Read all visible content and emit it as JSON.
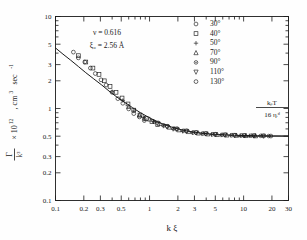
{
  "figure": {
    "background": "#fefefe",
    "ink": "#1a1a1a"
  },
  "annotations": {
    "nu": "ν = 0.616",
    "xi0": "ξ₀ = 2.56 Å",
    "asymptote_numerator": "kᵦT",
    "asymptote_denominator": "16 ηᵢᵈ"
  },
  "axes": {
    "xlabel": "k ξ",
    "ylabel": "Γ/k³ × 10¹² , cm³ sec⁻¹",
    "ylabel_parts": {
      "gamma": "Γ",
      "k3": "k³",
      "rest": "× 10",
      "exp": "12",
      "units": ", cm",
      "units_exp": "3",
      "units_tail": " sec",
      "units_tail_exp": "-1"
    },
    "xscale": "log",
    "yscale": "log",
    "xlim": [
      0.1,
      30
    ],
    "ylim": [
      0.1,
      10
    ],
    "xticks": [
      0.1,
      0.2,
      0.3,
      0.5,
      1,
      2,
      3,
      5,
      10,
      20,
      30
    ],
    "xticklabels": [
      "0.1",
      "0.2",
      "0.3",
      "0.5",
      "1",
      "2",
      "3",
      "5",
      "10",
      "20",
      "30"
    ],
    "yticks": [
      0.1,
      0.2,
      0.3,
      0.5,
      1,
      2,
      3,
      5,
      10
    ],
    "yticklabels": [
      "0.1",
      "0.2",
      "0.3",
      "0.5",
      "1",
      "2",
      "3",
      "5",
      "10"
    ],
    "grid": false,
    "ticks_direction": "in"
  },
  "legend": {
    "position": "top-right-inside",
    "entries": [
      {
        "label": "30°",
        "marker": "circle"
      },
      {
        "label": "40°",
        "marker": "square"
      },
      {
        "label": "50°",
        "marker": "plus"
      },
      {
        "label": "70°",
        "marker": "triangle-up"
      },
      {
        "label": "90°",
        "marker": "asterisk"
      },
      {
        "label": "110°",
        "marker": "triangle-down"
      },
      {
        "label": "130°",
        "marker": "hexagon"
      }
    ]
  },
  "chart_data": {
    "type": "scatter",
    "title": "",
    "xlabel": "k ξ",
    "ylabel": "Γ/k³ × 10¹² , cm³ sec⁻¹",
    "xscale": "log",
    "yscale": "log",
    "xlim": [
      0.1,
      30
    ],
    "ylim": [
      0.1,
      10
    ],
    "grid": false,
    "legend_position": "top-right",
    "annotations": [
      "ν = 0.616",
      "ξ₀ = 2.56 Å",
      "kᵦT / 16 ηᵢᵈ"
    ],
    "asymptote": {
      "y": 0.5,
      "label": "kᵦT / 16 ηᵢᵈ",
      "x_from": 8.5,
      "x_to": 30
    },
    "theory_curve": {
      "name": "Kawasaki theory",
      "x": [
        0.1,
        0.12,
        0.145,
        0.175,
        0.21,
        0.255,
        0.31,
        0.37,
        0.45,
        0.55,
        0.66,
        0.8,
        0.97,
        1.17,
        1.42,
        1.72,
        2.08,
        2.52,
        3.05,
        3.7,
        4.48,
        5.43,
        6.57,
        7.96,
        9.64,
        11.7,
        14.1,
        17.1,
        20.7,
        25.0,
        30.0
      ],
      "y": [
        4.55,
        3.9,
        3.35,
        2.86,
        2.45,
        2.1,
        1.8,
        1.55,
        1.33,
        1.16,
        1.02,
        0.9,
        0.805,
        0.73,
        0.672,
        0.628,
        0.594,
        0.569,
        0.551,
        0.538,
        0.528,
        0.521,
        0.516,
        0.512,
        0.509,
        0.507,
        0.506,
        0.505,
        0.504,
        0.503,
        0.503
      ]
    },
    "series": [
      {
        "name": "30°",
        "marker": "circle",
        "x": [
          0.155,
          0.175,
          0.205,
          0.235,
          0.265,
          0.305,
          0.345,
          0.4,
          0.46,
          0.52,
          0.6,
          0.68,
          0.78,
          0.88
        ],
        "y": [
          4.1,
          3.55,
          3.2,
          2.75,
          2.4,
          2.05,
          1.8,
          1.5,
          1.28,
          1.14,
          0.99,
          0.88,
          0.81,
          0.74
        ]
      },
      {
        "name": "40°",
        "marker": "square",
        "x": [
          0.175,
          0.21,
          0.25,
          0.29,
          0.33,
          0.38,
          0.44,
          0.51,
          0.59,
          0.68,
          0.79,
          0.92,
          1.06,
          1.22
        ],
        "y": [
          3.75,
          3.2,
          2.75,
          2.35,
          2.0,
          1.74,
          1.5,
          1.3,
          1.12,
          0.96,
          0.85,
          0.78,
          0.72,
          0.67
        ]
      },
      {
        "name": "50°",
        "marker": "plus",
        "x": [
          0.4,
          0.52,
          0.68,
          0.86,
          1.1,
          1.4,
          1.78,
          2.25,
          2.85,
          3.6,
          4.55,
          5.75,
          7.3,
          9.2,
          11.5
        ],
        "y": [
          1.52,
          1.22,
          0.94,
          0.8,
          0.72,
          0.645,
          0.595,
          0.565,
          0.545,
          0.53,
          0.52,
          0.515,
          0.512,
          0.508,
          0.505
        ]
      },
      {
        "name": "70°",
        "marker": "triangle-up",
        "x": [
          0.6,
          0.78,
          1.0,
          1.28,
          1.62,
          2.05,
          2.6,
          3.3,
          4.15,
          5.25,
          6.65,
          8.4,
          10.6,
          13.4
        ],
        "y": [
          1.05,
          0.85,
          0.765,
          0.685,
          0.625,
          0.585,
          0.56,
          0.54,
          0.528,
          0.52,
          0.514,
          0.51,
          0.507,
          0.504
        ]
      },
      {
        "name": "90°",
        "marker": "asterisk",
        "x": [
          0.88,
          1.12,
          1.42,
          1.8,
          2.28,
          2.9,
          3.68,
          4.65,
          5.9,
          7.45,
          9.45,
          12.0,
          15.2,
          18.5
        ],
        "y": [
          0.77,
          0.715,
          0.655,
          0.605,
          0.572,
          0.548,
          0.534,
          0.524,
          0.517,
          0.512,
          0.508,
          0.506,
          0.504,
          0.502
        ]
      },
      {
        "name": "110°",
        "marker": "triangle-down",
        "x": [
          1.2,
          1.52,
          1.92,
          2.45,
          3.1,
          3.92,
          4.97,
          6.3,
          7.98,
          10.1,
          12.8,
          16.2
        ],
        "y": [
          0.695,
          0.638,
          0.598,
          0.568,
          0.546,
          0.532,
          0.522,
          0.516,
          0.511,
          0.507,
          0.505,
          0.503
        ]
      },
      {
        "name": "130°",
        "marker": "hexagon",
        "x": [
          1.55,
          1.96,
          2.48,
          3.14,
          3.98,
          5.04,
          6.38,
          8.08,
          10.2,
          13.0,
          16.4,
          19.5
        ],
        "y": [
          0.64,
          0.6,
          0.57,
          0.548,
          0.534,
          0.524,
          0.517,
          0.512,
          0.508,
          0.506,
          0.503,
          0.502
        ]
      }
    ]
  }
}
